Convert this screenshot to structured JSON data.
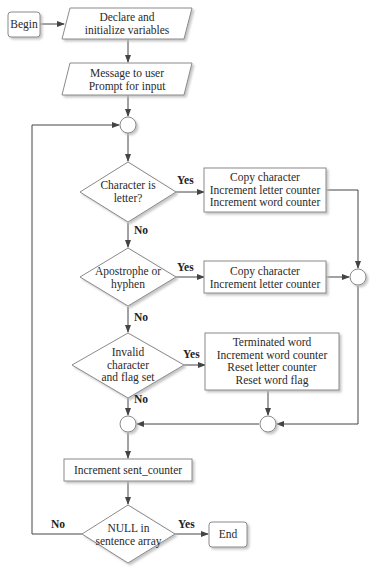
{
  "diagram": {
    "type": "flowchart",
    "nodes": {
      "begin": {
        "label": "Begin",
        "shape": "terminal"
      },
      "declare": {
        "line1": "Declare and",
        "line2": "initialize variables",
        "shape": "io"
      },
      "message": {
        "line1": "Message to user",
        "line2": "Prompt for input",
        "shape": "io"
      },
      "decision_letter": {
        "line1": "Character is",
        "line2": "letter?",
        "shape": "decision"
      },
      "box_letter": {
        "line1": "Copy character",
        "line2": "Increment letter counter",
        "line3": "Increment word counter",
        "shape": "process"
      },
      "decision_apostrophe": {
        "line1": "Apostrophe or",
        "line2": "hyphen",
        "shape": "decision"
      },
      "box_apostrophe": {
        "line1": "Copy character",
        "line2": "Increment letter counter",
        "shape": "process"
      },
      "decision_invalid": {
        "line1": "Invalid",
        "line2": "character",
        "line3": "and flag set",
        "shape": "decision"
      },
      "box_invalid": {
        "line1": "Terminated word",
        "line2": "Increment word counter",
        "line3": "Reset letter counter",
        "line4": "Reset word flag",
        "shape": "process"
      },
      "increment_sent": {
        "label": "Increment sent_counter",
        "shape": "process"
      },
      "decision_null": {
        "line1": "NULL in",
        "line2": "sentence array",
        "shape": "decision"
      },
      "end": {
        "label": "End",
        "shape": "terminal"
      }
    },
    "edge_labels": {
      "letter_yes": "Yes",
      "letter_no": "No",
      "apostrophe_yes": "Yes",
      "apostrophe_no": "No",
      "invalid_yes": "Yes",
      "invalid_no": "No",
      "null_no": "No",
      "null_yes": "Yes"
    },
    "colors": {
      "line": "#444444",
      "shape_fill": "#ffffff",
      "shape_stroke": "#8a8a8a",
      "shadow": "#d0d0d0"
    }
  }
}
